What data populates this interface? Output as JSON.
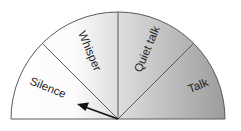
{
  "diagram": {
    "type": "semicircle-gauge",
    "title": "",
    "segments": [
      {
        "label": "Silence",
        "start_deg": 180,
        "end_deg": 135
      },
      {
        "label": "Whisper",
        "start_deg": 135,
        "end_deg": 90
      },
      {
        "label": "Quiet talk",
        "start_deg": 90,
        "end_deg": 45
      },
      {
        "label": "Talk",
        "start_deg": 45,
        "end_deg": 0
      }
    ],
    "pointer": {
      "points_to": "Silence",
      "angle_deg": 157
    },
    "colors": {
      "fill_left": "#ffffff",
      "fill_right": "#9a9a9a",
      "outline": "#555555",
      "arrow": "#111111"
    }
  }
}
